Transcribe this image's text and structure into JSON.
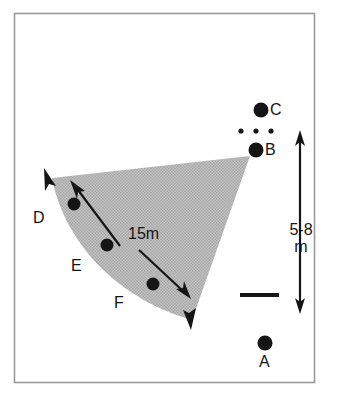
{
  "figure": {
    "type": "schematic-diagram",
    "caption_text": "",
    "background_color": "#ffffff",
    "frame_color": "#9a9a9a",
    "wedge_fill_color": "#b8b8b8",
    "ink_color": "#151515",
    "frame": {
      "x": 14,
      "y": 13,
      "width": 301,
      "height": 370
    },
    "points": [
      {
        "id": "A",
        "label": "A",
        "cx": 265,
        "cy": 343,
        "r": 7.5,
        "label_x": 259,
        "label_y": 354
      },
      {
        "id": "B",
        "label": "B",
        "cx": 256,
        "cy": 150,
        "r": 7.5,
        "label_x": 265,
        "label_y": 142
      },
      {
        "id": "C",
        "label": "C",
        "cx": 261,
        "cy": 110,
        "r": 7.5,
        "label_x": 270,
        "label_y": 102
      },
      {
        "id": "D",
        "label": "D",
        "cx": null,
        "cy": null,
        "r": null,
        "label_x": 33,
        "label_y": 210
      },
      {
        "id": "E",
        "label": "E",
        "cx": null,
        "cy": null,
        "r": null,
        "label_x": 71,
        "label_y": 258
      },
      {
        "id": "F",
        "label": "F",
        "cx": null,
        "cy": null,
        "r": null,
        "label_x": 114,
        "label_y": 295
      }
    ],
    "wedge_interior_dots": [
      {
        "cx": 74,
        "cy": 204,
        "r": 6.5
      },
      {
        "cx": 107,
        "cy": 245,
        "r": 6.5
      },
      {
        "cx": 153,
        "cy": 284,
        "r": 6.5
      }
    ],
    "dotted_row": {
      "description": "three small dots between C and B",
      "dots": [
        {
          "cx": 241,
          "cy": 131,
          "r": 2.6
        },
        {
          "cx": 256,
          "cy": 131,
          "r": 2.6
        },
        {
          "cx": 271,
          "cy": 131,
          "r": 2.6
        }
      ]
    },
    "arrows": {
      "up_left_arrow": {
        "from_x": 118,
        "from_y": 244,
        "to_x": 72,
        "to_y": 183
      },
      "down_right_arrow": {
        "from_x": 139,
        "from_y": 250,
        "to_x": 189,
        "to_y": 296
      },
      "wedge_edge_arrowhead_top": {
        "tip_x": 46,
        "tip_y": 171,
        "angle_deg": -55
      },
      "wedge_edge_arrowhead_bottom": {
        "tip_x": 190,
        "tip_y": 325,
        "angle_deg": 100
      }
    },
    "annotations": {
      "distance_label": "15m",
      "distance_label_x": 128,
      "distance_label_y": 226,
      "vertical_dimension_line1": "5-8",
      "vertical_dimension_line2": "m",
      "vertical_dimension_x": 300,
      "vertical_dimension_y": 226,
      "vertical_arrow_top_y": 133,
      "vertical_arrow_bottom_y": 311,
      "vertical_arrow_x": 300,
      "scale_bar": {
        "x1": 240,
        "x2": 279,
        "y": 295,
        "thickness": 4
      }
    }
  }
}
